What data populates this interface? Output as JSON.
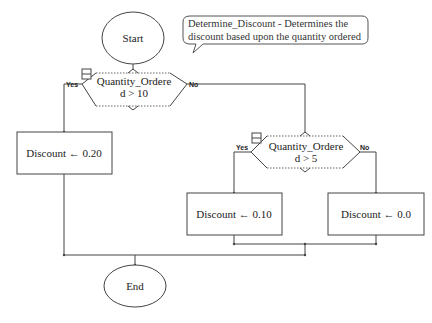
{
  "diagram": {
    "type": "flowchart",
    "start": {
      "label": "Start"
    },
    "end": {
      "label": "End"
    },
    "comment": {
      "line1": "Determine_Discount - Determines the",
      "line2": "discount based upon the quantity ordered"
    },
    "decisions": [
      {
        "line1": "Quantity_Ordere",
        "line2": "d > 10",
        "yes_label": "Yes",
        "no_label": "No"
      },
      {
        "line1": "Quantity_Ordere",
        "line2": "d > 5",
        "yes_label": "Yes",
        "no_label": "No"
      }
    ],
    "processes": [
      {
        "label": "Discount ← 0.20"
      },
      {
        "label": "Discount ← 0.10"
      },
      {
        "label": "Discount ← 0.0"
      }
    ],
    "colors": {
      "stroke": "#333333",
      "background": "#ffffff",
      "text": "#222222"
    }
  }
}
